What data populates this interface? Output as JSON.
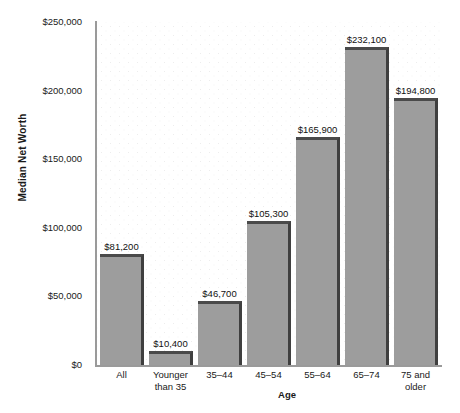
{
  "chart_data": {
    "type": "bar",
    "title": "",
    "xlabel": "Age",
    "ylabel": "Median Net Worth",
    "categories": [
      "All",
      "Younger than 35",
      "35–44",
      "45–54",
      "55–64",
      "65–74",
      "75 and older"
    ],
    "category_lines": [
      [
        "All"
      ],
      [
        "Younger",
        "than 35"
      ],
      [
        "35–44"
      ],
      [
        "45–54"
      ],
      [
        "55–64"
      ],
      [
        "65–74"
      ],
      [
        "75 and",
        "older"
      ]
    ],
    "values": [
      81200,
      10400,
      46700,
      105300,
      165900,
      232100,
      194800
    ],
    "value_labels": [
      "$81,200",
      "$10,400",
      "$46,700",
      "$105,300",
      "$165,900",
      "$232,100",
      "$194,800"
    ],
    "ylim": [
      0,
      250000
    ],
    "ytick_values": [
      0,
      50000,
      100000,
      150000,
      200000,
      250000
    ],
    "ytick_labels": [
      "$0",
      "$50,000",
      "$100,000",
      "$150,000",
      "$200,000",
      "$250,000"
    ],
    "grid": "dotted-light",
    "legend": "none",
    "bar_color": "#9d9d9d",
    "bar_edge_color": "#4a4a4a",
    "axis_color": "#9a9a9a",
    "text_color": "#1a1a1a",
    "background_color": "#ffffff"
  }
}
